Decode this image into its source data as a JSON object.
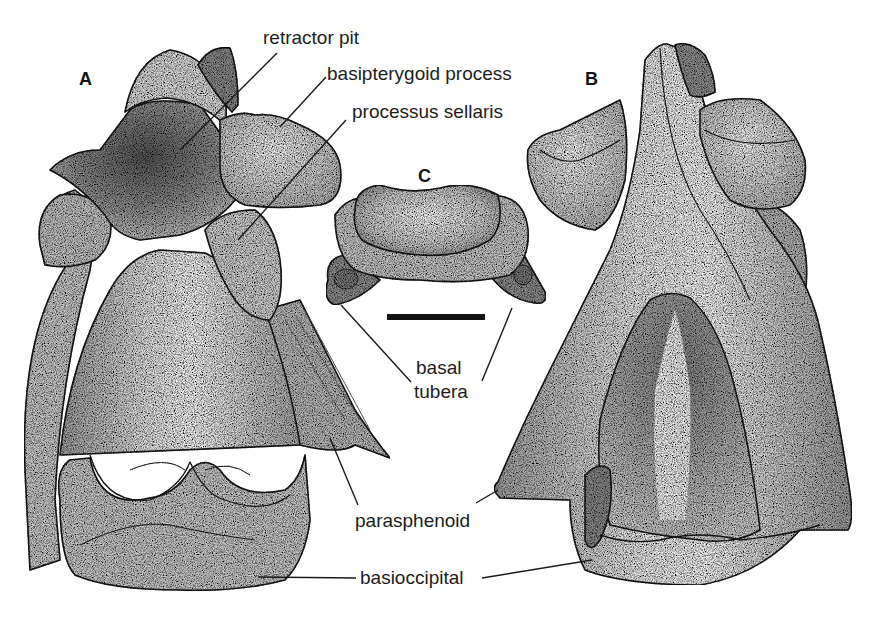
{
  "figure": {
    "panels": [
      {
        "id": "A",
        "label": "A"
      },
      {
        "id": "B",
        "label": "B"
      },
      {
        "id": "C",
        "label": "C"
      }
    ],
    "annotations": {
      "retractor_pit": "retractor pit",
      "basipterygoid_process": "basipterygoid process",
      "processus_sellaris": "processus sellaris",
      "basal_tubera_line1": "basal",
      "basal_tubera_line2": "tubera",
      "parasphenoid": "parasphenoid",
      "basioccipital": "basioccipital"
    },
    "scale_bar": {
      "present": true
    },
    "colors": {
      "ink": "#1a1a1a",
      "stipple_dark": "#5a5a5a",
      "stipple_mid": "#9a9a9a",
      "stipple_light": "#d6d6d6",
      "background": "#ffffff"
    }
  }
}
